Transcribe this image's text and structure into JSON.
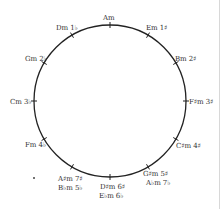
{
  "diagram": {
    "circle": {
      "cx": 110,
      "cy": 101,
      "r": 76,
      "stroke": "#222222"
    },
    "keys": [
      {
        "label": "Am",
        "angle": 0
      },
      {
        "label": "Em 1♯",
        "angle": 30
      },
      {
        "label": "Bm 2♯",
        "angle": 60
      },
      {
        "label": "F♯m 3♯",
        "angle": 90
      },
      {
        "label": "C♯m 4♯",
        "angle": 120
      },
      {
        "label": "G♯m 5♯",
        "label2": "A♭m 7♭",
        "angle": 150
      },
      {
        "label": "D♯m 6♯",
        "label2": "E♭m 6♭",
        "angle": 180
      },
      {
        "label": "A♯m 7♯",
        "label2": "B♭m 5♭",
        "angle": 210
      },
      {
        "label": "Fm 4♭",
        "angle": 240
      },
      {
        "label": "Cm 3♭",
        "angle": 270
      },
      {
        "label": "Gm 2♭",
        "angle": 300
      },
      {
        "label": "Dm 1♭",
        "angle": 330
      }
    ]
  }
}
